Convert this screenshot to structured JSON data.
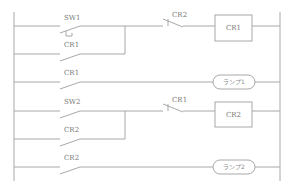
{
  "diagram": {
    "type": "ladder-diagram",
    "colors": {
      "line": "#a8a8a8",
      "text": "#7a7a7a",
      "background": "#ffffff"
    },
    "rungs": [
      {
        "id": 1,
        "contacts": [
          {
            "label": "SW1",
            "type": "NO-pushbutton"
          },
          {
            "label": "CR1",
            "type": "NO",
            "parallel_branch": true
          },
          {
            "label": "CR2",
            "type": "NC"
          }
        ],
        "output": {
          "label": "CR1",
          "type": "relay-coil"
        }
      },
      {
        "id": 2,
        "contacts": [
          {
            "label": "CR1",
            "type": "NO"
          }
        ],
        "output": {
          "label": "ランプ1",
          "type": "lamp"
        }
      },
      {
        "id": 3,
        "contacts": [
          {
            "label": "SW2",
            "type": "NO"
          },
          {
            "label": "CR2",
            "type": "NO",
            "parallel_branch": true
          },
          {
            "label": "CR1",
            "type": "NC"
          }
        ],
        "output": {
          "label": "CR2",
          "type": "relay-coil"
        }
      },
      {
        "id": 4,
        "contacts": [
          {
            "label": "CR2",
            "type": "NO"
          }
        ],
        "output": {
          "label": "ランプ2",
          "type": "lamp"
        }
      }
    ]
  }
}
